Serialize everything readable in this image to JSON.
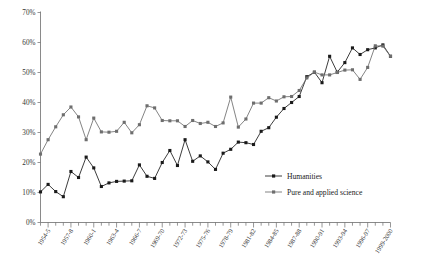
{
  "chart_data": {
    "type": "line",
    "title": "",
    "xlabel": "",
    "ylabel": "",
    "ylim": [
      0,
      70
    ],
    "yticks": [
      0,
      10,
      20,
      30,
      40,
      50,
      60,
      70
    ],
    "ytick_labels": [
      "0%",
      "10%",
      "20%",
      "30%",
      "40%",
      "50%",
      "60%",
      "70%"
    ],
    "grid": false,
    "legend_position": "center-right",
    "x": [
      "1953-4",
      "1954-5",
      "1955-6",
      "1956-7",
      "1957-8",
      "1958-9",
      "1959-60",
      "1960-1",
      "1961-2",
      "1962-3",
      "1963-4",
      "1964-5",
      "1965-6",
      "1966-7",
      "1967-8",
      "1968-9",
      "1969-70",
      "1970-1",
      "1971-2",
      "1972-73",
      "1973-74",
      "1974-75",
      "1975-76",
      "1976-77",
      "1977-78",
      "1978-79",
      "1979-80",
      "1980-81",
      "1981-82",
      "1982-83",
      "1983-84",
      "1984-85",
      "1985-86",
      "1986-87",
      "1987-88",
      "1988-89",
      "1989-90",
      "1990-91",
      "1991-92",
      "1992-93",
      "1993-94",
      "1994-95",
      "1995-96",
      "1996-97",
      "1997-98",
      "1998-99",
      "1999-2000"
    ],
    "xtick_labels_shown": [
      "1954-5",
      "1957-8",
      "1960-1",
      "1963-4",
      "1966-7",
      "1969-70",
      "1972-73",
      "1975-76",
      "1978-79",
      "1981-82",
      "1984-85",
      "1987-88",
      "1990-91",
      "1993-94",
      "1996-97",
      "1999-2000"
    ],
    "xtick_label_indices": [
      1,
      4,
      7,
      10,
      13,
      16,
      19,
      22,
      25,
      28,
      31,
      34,
      37,
      40,
      43,
      46
    ],
    "series": [
      {
        "name": "Humanities",
        "color": "#1a1a1a",
        "marker": "square",
        "values": [
          10.2,
          12.7,
          10.3,
          8.6,
          17.0,
          15.0,
          21.8,
          18.2,
          12.0,
          13.2,
          13.7,
          13.8,
          13.9,
          19.2,
          15.4,
          14.7,
          20.0,
          24.0,
          19.0,
          27.6,
          20.4,
          22.2,
          20.2,
          17.7,
          23.1,
          24.4,
          26.8,
          26.6,
          26.0,
          30.4,
          31.6,
          35.1,
          38.0,
          40.0,
          42.0,
          48.6,
          50.1,
          46.6,
          55.4,
          50.1,
          53.3,
          58.2,
          56.0,
          57.6,
          58.2,
          59.2,
          55.4
        ]
      },
      {
        "name": "Pure and applied science",
        "color": "#6e6e6e",
        "marker": "square",
        "values": [
          22.8,
          27.6,
          31.9,
          35.9,
          38.5,
          35.2,
          27.6,
          34.8,
          30.2,
          30.1,
          30.4,
          33.4,
          29.9,
          32.6,
          38.9,
          38.2,
          34.0,
          33.9,
          33.9,
          32.0,
          34.0,
          33.0,
          33.4,
          32.0,
          33.2,
          41.8,
          31.8,
          34.5,
          39.8,
          39.8,
          41.6,
          40.5,
          41.9,
          42.0,
          44.0,
          48.2,
          50.1,
          49.2,
          49.2,
          50.0,
          50.8,
          50.9,
          47.7,
          51.7,
          58.9,
          58.8,
          55.4
        ]
      }
    ]
  },
  "legend": {
    "items": [
      {
        "label": "Humanities"
      },
      {
        "label": "Pure and applied science"
      }
    ]
  }
}
